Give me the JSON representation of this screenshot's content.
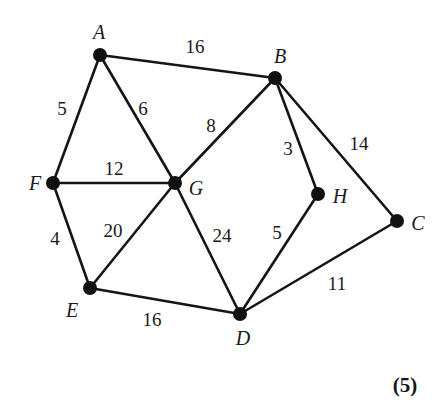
{
  "figure": {
    "marks_text": "(5)",
    "marks_x": 405,
    "marks_y": 385,
    "stroke_color": "#151515",
    "vertex_color": "#111111",
    "background_color": "#ffffff"
  },
  "chart_data": {
    "type": "diagram",
    "diagram_type": "weighted-undirected-graph",
    "title": "",
    "nodes": [
      {
        "id": "A",
        "label": "A",
        "x": 100,
        "y": 55,
        "label_x": 99,
        "label_y": 32
      },
      {
        "id": "B",
        "label": "B",
        "x": 275,
        "y": 78,
        "label_x": 280,
        "label_y": 56
      },
      {
        "id": "C",
        "label": "C",
        "x": 397,
        "y": 221,
        "label_x": 418,
        "label_y": 223
      },
      {
        "id": "D",
        "label": "D",
        "x": 240,
        "y": 314,
        "label_x": 243,
        "label_y": 338
      },
      {
        "id": "E",
        "label": "E",
        "x": 90,
        "y": 288,
        "label_x": 72,
        "label_y": 310
      },
      {
        "id": "F",
        "label": "F",
        "x": 53,
        "y": 183,
        "label_x": 35,
        "label_y": 183
      },
      {
        "id": "G",
        "label": "G",
        "x": 175,
        "y": 183,
        "label_x": 196,
        "label_y": 188
      },
      {
        "id": "H",
        "label": "H",
        "x": 318,
        "y": 194,
        "label_x": 340,
        "label_y": 196
      }
    ],
    "edges": [
      {
        "from": "A",
        "to": "B",
        "weight": 16,
        "label_x": 195,
        "label_y": 46
      },
      {
        "from": "A",
        "to": "F",
        "weight": 5,
        "label_x": 62,
        "label_y": 108
      },
      {
        "from": "A",
        "to": "G",
        "weight": 6,
        "label_x": 143,
        "label_y": 108
      },
      {
        "from": "B",
        "to": "G",
        "weight": 8,
        "label_x": 211,
        "label_y": 125
      },
      {
        "from": "B",
        "to": "H",
        "weight": 3,
        "label_x": 288,
        "label_y": 148
      },
      {
        "from": "B",
        "to": "C",
        "weight": 14,
        "label_x": 359,
        "label_y": 143
      },
      {
        "from": "F",
        "to": "G",
        "weight": 12,
        "label_x": 114,
        "label_y": 168
      },
      {
        "from": "F",
        "to": "E",
        "weight": 4,
        "label_x": 55,
        "label_y": 238
      },
      {
        "from": "E",
        "to": "G",
        "weight": 20,
        "label_x": 113,
        "label_y": 230
      },
      {
        "from": "G",
        "to": "D",
        "weight": 24,
        "label_x": 222,
        "label_y": 235
      },
      {
        "from": "D",
        "to": "H",
        "weight": 5,
        "label_x": 277,
        "label_y": 232
      },
      {
        "from": "D",
        "to": "C",
        "weight": 11,
        "label_x": 337,
        "label_y": 283
      },
      {
        "from": "E",
        "to": "D",
        "weight": 16,
        "label_x": 152,
        "label_y": 319
      }
    ],
    "node_radius": 7,
    "xlabel": "",
    "ylabel": "",
    "legend": []
  }
}
